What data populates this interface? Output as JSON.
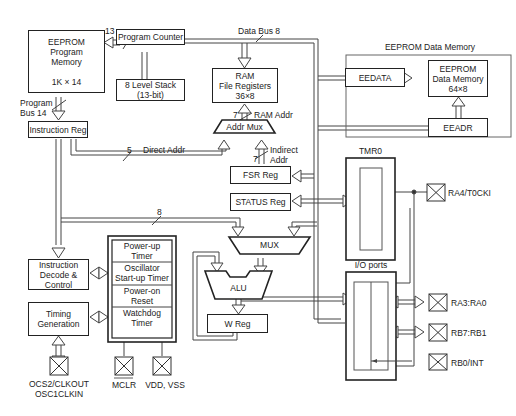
{
  "blocks": {
    "program_memory": {
      "line1": "EEPROM",
      "line2": "Program",
      "line3": "Memory",
      "size": "1K × 14"
    },
    "program_counter": "Program Counter",
    "stack": {
      "line1": "8 Level Stack",
      "line2": "(13-bit)"
    },
    "ram": {
      "line1": "RAM",
      "line2": "File Registers",
      "line3": "36×8"
    },
    "instruction_reg": "Instruction Reg",
    "addr_mux": "Addr Mux",
    "fsr_reg": "FSR Reg",
    "status_reg": "STATUS Reg",
    "mux": "MUX",
    "alu": "ALU",
    "w_reg": "W Reg",
    "instruction_decode": {
      "line1": "Instruction",
      "line2": "Decode &",
      "line3": "Control"
    },
    "timing_generation": {
      "line1": "Timing",
      "line2": "Generation"
    },
    "power_up_timer": {
      "line1": "Power-up",
      "line2": "Timer"
    },
    "oscillator_timer": {
      "line1": "Oscillator",
      "line2": "Start-up Timer"
    },
    "power_on_reset": {
      "line1": "Power-on",
      "line2": "Reset"
    },
    "watchdog_timer": {
      "line1": "Watchdog",
      "line2": "Timer"
    },
    "eeprom_data_group": "EEPROM Data Memory",
    "eedata": "EEDATA",
    "eeprom_data_memory": {
      "line1": "EEPROM",
      "line2": "Data Memory",
      "line3": "64×8"
    },
    "eeadr": "EEADR",
    "tmr0": "TMR0",
    "io_ports": "I/O ports"
  },
  "buses": {
    "data_bus": "Data Bus 8",
    "pc_width": "13",
    "program_bus": {
      "line1": "Program",
      "line2": "Bus 14"
    },
    "ram_addr_width": "7",
    "ram_addr": "RAM Addr",
    "direct_addr_width": "5",
    "direct_addr": "Direct Addr",
    "indirect_width": "7",
    "indirect_addr": {
      "line1": "Indirect",
      "line2": "Addr"
    },
    "literal_width": "8"
  },
  "pins": {
    "ra4": "RA4/T0CKI",
    "ra3_ra0": "RA3:RA0",
    "rb7_rb1": "RB7:RB1",
    "rb0": "RB0/INT",
    "osc": {
      "line1": "OCS2/CLKOUT",
      "line2": "OSC1CLKIN"
    },
    "mclr": "MCLR",
    "vdd_vss": "VDD, VSS"
  }
}
